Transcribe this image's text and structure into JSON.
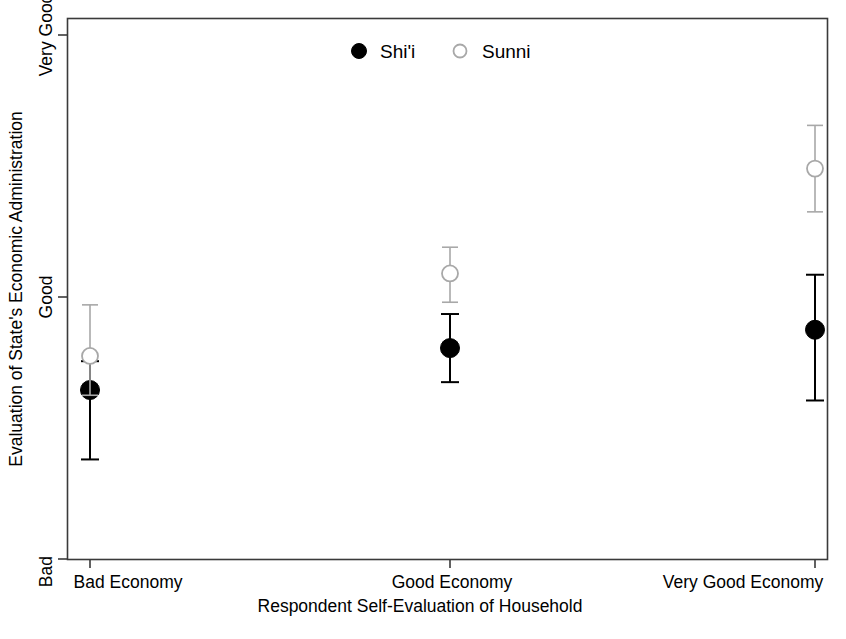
{
  "chart_data": {
    "type": "scatter",
    "title": "",
    "subtitle": "",
    "xlabel": "Respondent Self-Evaluation of Household",
    "ylabel": "Evaluation of State's Economic Administration",
    "categories": [
      "Bad Economy",
      "Good Economy",
      "Very Good Economy"
    ],
    "x": [
      1,
      2,
      3
    ],
    "ylim": [
      1.0,
      5.0
    ],
    "ytick_values": [
      1,
      3,
      5
    ],
    "ytick_labels": [
      "Bad",
      "Good",
      "Very Good"
    ],
    "grid": false,
    "legend_position": "top-center",
    "series": [
      {
        "name": "Shi'i",
        "marker": "filled-circle",
        "color": "#000000",
        "values": [
          2.29,
          2.61,
          2.75
        ],
        "ci_low": [
          1.76,
          2.35,
          2.21
        ],
        "ci_high": [
          2.51,
          2.87,
          3.17
        ]
      },
      {
        "name": "Sunni",
        "marker": "open-circle",
        "color": "#a8a8a8",
        "values": [
          2.55,
          3.18,
          3.98
        ],
        "ci_low": [
          2.25,
          2.96,
          3.65
        ],
        "ci_high": [
          2.94,
          3.38,
          4.31
        ]
      }
    ]
  },
  "legend": {
    "entries": [
      {
        "label": "Shi'i",
        "marker": "filled-circle"
      },
      {
        "label": "Sunni",
        "marker": "open-circle"
      }
    ]
  },
  "axes": {
    "y_title": "Evaluation of State's Economic Administration",
    "x_title": "Respondent Self-Evaluation of Household",
    "y_ticks": [
      "Very Good",
      "Good",
      "Bad"
    ],
    "x_ticks": [
      "Bad Economy",
      "Good Economy",
      "Very Good Economy"
    ]
  },
  "colors": {
    "shii": "#000000",
    "sunni": "#a8a8a8",
    "axis": "#3a3a3a",
    "background": "#ffffff"
  }
}
